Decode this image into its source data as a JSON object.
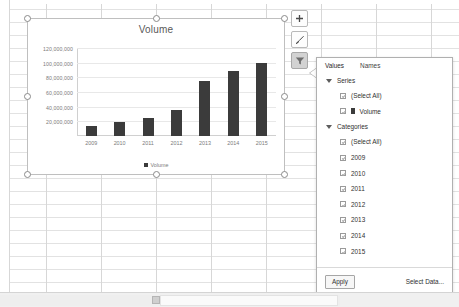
{
  "chart_data": {
    "type": "bar",
    "title": "Volume",
    "xlabel": "",
    "ylabel": "",
    "categories": [
      "2009",
      "2010",
      "2011",
      "2012",
      "2013",
      "2014",
      "2015"
    ],
    "series": [
      {
        "name": "Volume",
        "values": [
          14000000,
          19000000,
          25000000,
          35000000,
          75000000,
          88000000,
          99000000
        ]
      }
    ],
    "ylim": [
      0,
      120000000
    ],
    "yticks": [
      "20,000,000",
      "40,000,000",
      "60,000,000",
      "80,000,000",
      "100,000,000",
      "120,000,000"
    ],
    "ytick_values": [
      20000000,
      40000000,
      60000000,
      80000000,
      100000000,
      120000000
    ],
    "grid": true,
    "legend": [
      "Volume"
    ],
    "legend_position": "bottom",
    "bar_color": "#3b3b3b"
  },
  "chart_buttons": [
    {
      "name": "chart-elements",
      "icon": "plus-icon",
      "active": false
    },
    {
      "name": "chart-styles",
      "icon": "brush-icon",
      "active": false
    },
    {
      "name": "chart-filters",
      "icon": "funnel-icon",
      "active": true
    }
  ],
  "filter_panel": {
    "tabs": [
      {
        "label": "Values",
        "selected": true
      },
      {
        "label": "Names",
        "selected": false
      }
    ],
    "groups": [
      {
        "label": "Series",
        "expanded": true,
        "items": [
          {
            "label": "(Select All)",
            "checked": true,
            "swatch": false
          },
          {
            "label": "Volume",
            "checked": true,
            "swatch": true
          }
        ]
      },
      {
        "label": "Categories",
        "expanded": true,
        "items": [
          {
            "label": "(Select All)",
            "checked": true,
            "swatch": false
          },
          {
            "label": "2009",
            "checked": true,
            "swatch": false
          },
          {
            "label": "2010",
            "checked": true,
            "swatch": false
          },
          {
            "label": "2011",
            "checked": true,
            "swatch": false
          },
          {
            "label": "2012",
            "checked": true,
            "swatch": false
          },
          {
            "label": "2013",
            "checked": true,
            "swatch": false
          },
          {
            "label": "2014",
            "checked": true,
            "swatch": false
          },
          {
            "label": "2015",
            "checked": true,
            "swatch": false
          }
        ]
      }
    ],
    "apply_label": "Apply",
    "select_data_label": "Select Data..."
  }
}
